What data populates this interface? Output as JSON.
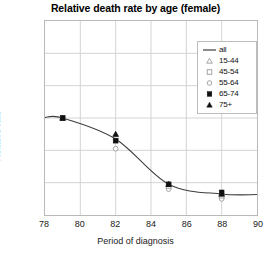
{
  "chart_data": {
    "type": "scatter",
    "title": "Relative death rate by age (female)",
    "xlabel": "Period of diagnosis",
    "ylabel": "Relative rate",
    "xlim": [
      78,
      90
    ],
    "ylim": [
      0.4,
      1.6
    ],
    "xticks": [
      "78",
      "80",
      "82",
      "84",
      "86",
      "88",
      "90"
    ],
    "yticks": [
      "0.4",
      "0.6",
      "0.8",
      "1",
      "1.2",
      "1.4",
      "1.6"
    ],
    "xtick_values": [
      78,
      80,
      82,
      84,
      86,
      88,
      90
    ],
    "ytick_values": [
      0.4,
      0.6,
      0.8,
      1.0,
      1.2,
      1.4,
      1.6
    ],
    "grid": true,
    "legend_position": "top-right",
    "x": [
      79,
      82,
      85,
      88
    ],
    "line_color": "#3d3d3d",
    "marker_color": "#111111",
    "series": [
      {
        "name": "all",
        "marker": "line",
        "values": [
          1.0,
          0.87,
          0.59,
          0.53
        ]
      },
      {
        "name": "15-44",
        "marker": "triangle-open",
        "values": [
          1.0,
          0.9,
          0.59,
          0.53
        ]
      },
      {
        "name": "45-54",
        "marker": "square-open",
        "values": [
          1.0,
          0.86,
          0.58,
          0.52
        ]
      },
      {
        "name": "55-64",
        "marker": "circle-open",
        "values": [
          1.0,
          0.81,
          0.56,
          0.5
        ]
      },
      {
        "name": "65-74",
        "marker": "square-filled",
        "values": [
          1.0,
          0.86,
          0.59,
          0.54
        ]
      },
      {
        "name": "75+",
        "marker": "triangle-filled",
        "values": [
          1.0,
          0.9,
          0.59,
          0.53
        ]
      }
    ],
    "legend": [
      {
        "label": "all",
        "marker": "line"
      },
      {
        "label": "15-44",
        "marker": "triangle-open"
      },
      {
        "label": "45-54",
        "marker": "square-open"
      },
      {
        "label": "55-64",
        "marker": "circle-open"
      },
      {
        "label": "65-74",
        "marker": "square-filled"
      },
      {
        "label": "75+",
        "marker": "triangle-filled"
      }
    ]
  }
}
